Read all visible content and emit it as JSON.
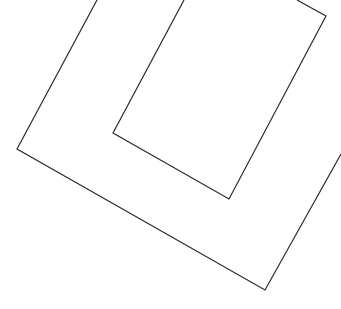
{
  "canvas": {
    "width": 341,
    "height": 309,
    "background": "#ffffff"
  },
  "stroke": {
    "color": "#2a2a2a",
    "width": 1.2
  },
  "shapes": [
    {
      "name": "outer-outline",
      "points": "97,0 17,149 265,290 341,154"
    },
    {
      "name": "inner-outline",
      "points": "184,0 113,133 229,199 326,16 297,0"
    }
  ]
}
